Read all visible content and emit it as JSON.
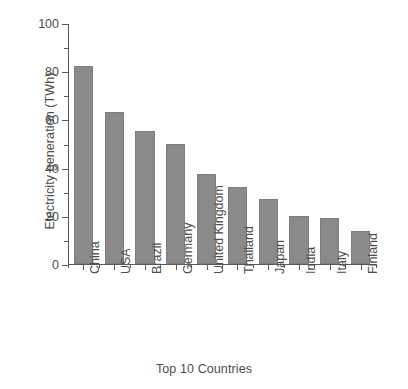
{
  "chart_data": {
    "type": "bar",
    "title": "",
    "xlabel": "Top 10 Countries",
    "ylabel": "Electricity generation (TWh)",
    "categories": [
      "China",
      "USA",
      "Brazil",
      "Germany",
      "United Kingdom",
      "Thailand",
      "Japan",
      "India",
      "Italy",
      "Finland"
    ],
    "values": [
      82,
      63,
      55,
      50,
      37.5,
      32,
      27,
      20,
      19,
      13.5
    ],
    "ylim": [
      0,
      100
    ],
    "xlim_note": "categorical, 10 bars",
    "ytick_labels": [
      "0",
      "20",
      "40",
      "60",
      "80",
      "100"
    ],
    "ytick_values": [
      0,
      20,
      40,
      60,
      80,
      100
    ],
    "yminor_tick_values": [
      10,
      30,
      50,
      70,
      90
    ],
    "grid": false,
    "legend": false,
    "bar_color": "#8a8a8a",
    "axis_color": "#5a5a5a",
    "text_color": "#4d4d4d",
    "background": "#ffffff"
  }
}
